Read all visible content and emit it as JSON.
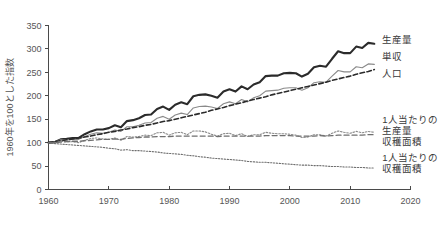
{
  "chart_data": {
    "type": "line",
    "title": "",
    "subtitle": "",
    "xlabel": "",
    "ylabel": "1960年を100とした指数",
    "xlim": [
      1960,
      2020
    ],
    "ylim": [
      0,
      350
    ],
    "xticks": [
      1960,
      1970,
      1980,
      1990,
      2000,
      2010,
      2020
    ],
    "xtick_labels": [
      "1960",
      "1970",
      "1980",
      "1990",
      "2000",
      "2010",
      "2020"
    ],
    "yticks": [
      0,
      50,
      100,
      150,
      200,
      250,
      300,
      350
    ],
    "ytick_labels": [
      "0",
      "50",
      "100",
      "150",
      "200",
      "250",
      "300",
      "350"
    ],
    "grid": false,
    "legend_position": "right-inline-labels",
    "x": [
      1960,
      1961,
      1962,
      1963,
      1964,
      1965,
      1966,
      1967,
      1968,
      1969,
      1970,
      1971,
      1972,
      1973,
      1974,
      1975,
      1976,
      1977,
      1978,
      1979,
      1980,
      1981,
      1982,
      1983,
      1984,
      1985,
      1986,
      1987,
      1988,
      1989,
      1990,
      1991,
      1992,
      1993,
      1994,
      1995,
      1996,
      1997,
      1998,
      1999,
      2000,
      2001,
      2002,
      2003,
      2004,
      2005,
      2006,
      2007,
      2008,
      2009,
      2010,
      2011,
      2012,
      2013,
      2014
    ],
    "series": [
      {
        "name": "生産量",
        "label": "生産量",
        "style": "solid-thick",
        "color": "#2b2b2b",
        "width": 2.1,
        "label_x": 2015,
        "label_y": 320,
        "values": [
          100,
          101,
          107,
          108,
          110,
          110,
          118,
          124,
          128,
          128,
          131,
          137,
          133,
          146,
          148,
          152,
          159,
          160,
          172,
          177,
          170,
          181,
          186,
          182,
          199,
          202,
          203,
          200,
          196,
          209,
          214,
          209,
          220,
          214,
          224,
          229,
          242,
          243,
          243,
          248,
          249,
          248,
          241,
          247,
          261,
          264,
          262,
          279,
          295,
          291,
          291,
          305,
          302,
          313,
          311
        ]
      },
      {
        "name": "単収",
        "label": "単収",
        "style": "solid-thin",
        "color": "#8a8a8a",
        "width": 1.1,
        "label_x": 2015,
        "label_y": 283,
        "values": [
          100,
          101,
          106,
          106,
          107,
          107,
          113,
          118,
          121,
          120,
          122,
          127,
          124,
          134,
          134,
          137,
          142,
          143,
          152,
          156,
          150,
          159,
          163,
          160,
          174,
          177,
          178,
          176,
          173,
          183,
          187,
          183,
          192,
          187,
          196,
          200,
          210,
          211,
          212,
          216,
          217,
          217,
          212,
          217,
          228,
          230,
          229,
          242,
          254,
          251,
          251,
          262,
          260,
          268,
          267
        ]
      },
      {
        "name": "人口",
        "label": "人口",
        "style": "dashed-thick",
        "color": "#2b2b2b",
        "width": 1.6,
        "label_x": 2015,
        "label_y": 248,
        "values": [
          100,
          102,
          104,
          106,
          108,
          110,
          112,
          114,
          117,
          119,
          122,
          124,
          127,
          129,
          132,
          134,
          137,
          139,
          142,
          145,
          147,
          150,
          153,
          156,
          159,
          162,
          165,
          169,
          172,
          175,
          179,
          182,
          185,
          189,
          192,
          195,
          198,
          202,
          205,
          208,
          211,
          214,
          217,
          220,
          223,
          226,
          229,
          233,
          236,
          239,
          242,
          246,
          249,
          252,
          256
        ]
      },
      {
        "name": "1人当たりの生産量",
        "label": "1人当たりの生産量",
        "style": "dotted-gray",
        "color": "#8a8a8a",
        "width": 1.1,
        "label_x": 2015,
        "label_y": 135,
        "values": [
          100,
          99,
          103,
          102,
          102,
          100,
          105,
          109,
          110,
          108,
          107,
          110,
          105,
          113,
          112,
          113,
          116,
          115,
          121,
          122,
          116,
          121,
          122,
          117,
          125,
          125,
          123,
          118,
          114,
          119,
          120,
          115,
          119,
          113,
          117,
          117,
          122,
          120,
          119,
          119,
          118,
          116,
          111,
          112,
          117,
          117,
          114,
          120,
          125,
          122,
          120,
          124,
          121,
          124,
          122
        ]
      },
      {
        "name": "収穫面積",
        "label": "収穫面積",
        "style": "dashed-gray",
        "color": "#6f6f6f",
        "width": 1.3,
        "label_x": 2015,
        "label_y": 112,
        "values": [
          100,
          100,
          101,
          102,
          103,
          103,
          104,
          105,
          106,
          107,
          107,
          108,
          107,
          109,
          110,
          111,
          112,
          112,
          113,
          113,
          113,
          114,
          114,
          114,
          114,
          114,
          114,
          114,
          113,
          114,
          114,
          114,
          114,
          114,
          114,
          114,
          115,
          115,
          115,
          115,
          115,
          114,
          114,
          114,
          114,
          115,
          114,
          115,
          116,
          116,
          116,
          116,
          116,
          117,
          117
        ]
      },
      {
        "name": "1人当たりの収穫面積",
        "label": "1人当たりの収穫面積",
        "style": "dotted-fine",
        "color": "#6f6f6f",
        "width": 1.1,
        "label_x": 2015,
        "label_y": 56,
        "values": [
          100,
          98,
          97,
          96,
          95,
          94,
          93,
          92,
          91,
          90,
          88,
          87,
          84,
          85,
          83,
          83,
          82,
          81,
          80,
          78,
          77,
          76,
          75,
          73,
          72,
          70,
          69,
          67,
          66,
          65,
          64,
          63,
          62,
          60,
          59,
          58,
          58,
          57,
          56,
          55,
          54,
          53,
          52,
          52,
          51,
          51,
          50,
          49,
          49,
          48,
          48,
          47,
          47,
          46,
          46
        ]
      }
    ],
    "labels": {
      "production": "生産量",
      "yield": "単収",
      "population": "人口",
      "production_per_capita_line1": "1人当たりの",
      "production_per_capita_line2": "生産量",
      "harvested_area": "収穫面積",
      "harvested_area_per_capita_line1": "1人当たりの",
      "harvested_area_per_capita_line2": "収穫面積"
    }
  }
}
